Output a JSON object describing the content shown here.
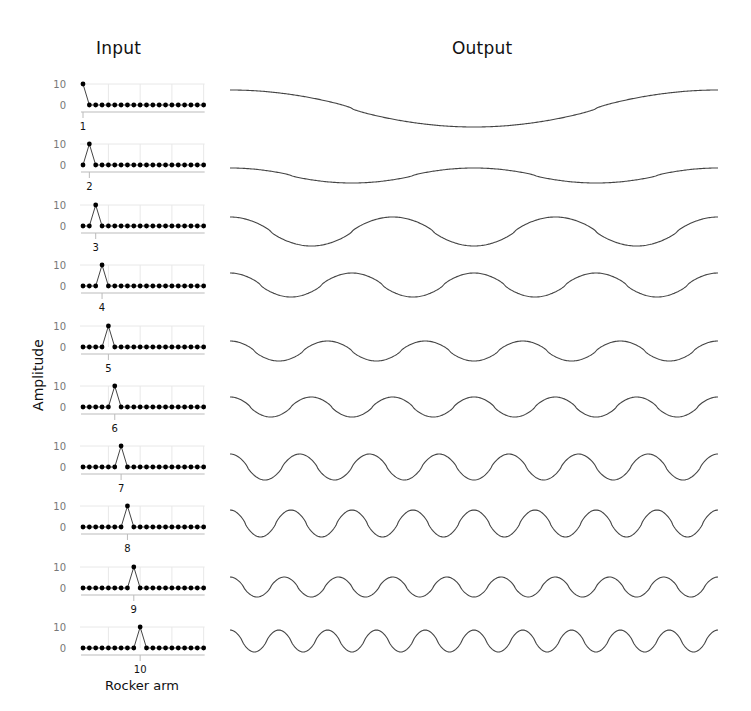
{
  "titles": {
    "input": "Input",
    "output": "Output"
  },
  "axes": {
    "ylabel": "Amplitude",
    "xlabel": "Rocker arm",
    "ytick_labels": [
      "10",
      "0"
    ]
  },
  "colors": {
    "line": "#444444",
    "dot": "#000000",
    "grid": "#e8e8e8",
    "axis": "#bbbbbb",
    "tick_text": "#777777"
  },
  "chart_data": {
    "type": "line",
    "xlabel": "Rocker arm",
    "ylabel": "Amplitude",
    "input_positions": 20,
    "input_ylim": [
      0,
      10
    ],
    "input_grid": {
      "horizontal": [
        10
      ],
      "vertical_at_positions": [
        5,
        10,
        15,
        20
      ]
    },
    "rows": [
      {
        "impulse_position": 1,
        "impulse_value": 10,
        "output_cycles": 1,
        "output_amplitude_px": 18.5,
        "output_phase": "cosine"
      },
      {
        "impulse_position": 2,
        "impulse_value": 10,
        "output_cycles": 2,
        "output_amplitude_px": 7.5,
        "output_phase": "cosine"
      },
      {
        "impulse_position": 3,
        "impulse_value": 10,
        "output_cycles": 3,
        "output_amplitude_px": 14.5,
        "output_phase": "cosine"
      },
      {
        "impulse_position": 4,
        "impulse_value": 10,
        "output_cycles": 4,
        "output_amplitude_px": 12,
        "output_phase": "cosine"
      },
      {
        "impulse_position": 5,
        "impulse_value": 10,
        "output_cycles": 5,
        "output_amplitude_px": 10,
        "output_phase": "cosine"
      },
      {
        "impulse_position": 6,
        "impulse_value": 10,
        "output_cycles": 6,
        "output_amplitude_px": 10,
        "output_phase": "cosine"
      },
      {
        "impulse_position": 7,
        "impulse_value": 10,
        "output_cycles": 7,
        "output_amplitude_px": 13,
        "output_phase": "cosine"
      },
      {
        "impulse_position": 8,
        "impulse_value": 10,
        "output_cycles": 8,
        "output_amplitude_px": 13.5,
        "output_phase": "cosine"
      },
      {
        "impulse_position": 9,
        "impulse_value": 10,
        "output_cycles": 9,
        "output_amplitude_px": 10,
        "output_phase": "cosine"
      },
      {
        "impulse_position": 10,
        "impulse_value": 10,
        "output_cycles": 10,
        "output_amplitude_px": 11,
        "output_phase": "cosine"
      }
    ],
    "legend": null,
    "grid": true
  },
  "layout": {
    "row_zero_y": [
      105,
      165,
      226,
      286,
      347,
      407,
      467,
      527,
      588,
      648
    ],
    "row_output_center_y": [
      108.5,
      175.5,
      231.5,
      285,
      351,
      407,
      467,
      523.5,
      587,
      641
    ],
    "input_x0": 83,
    "input_dx": 6.35,
    "input_px_per_unit": 2.1,
    "output_x0": 230,
    "output_x1": 718
  }
}
